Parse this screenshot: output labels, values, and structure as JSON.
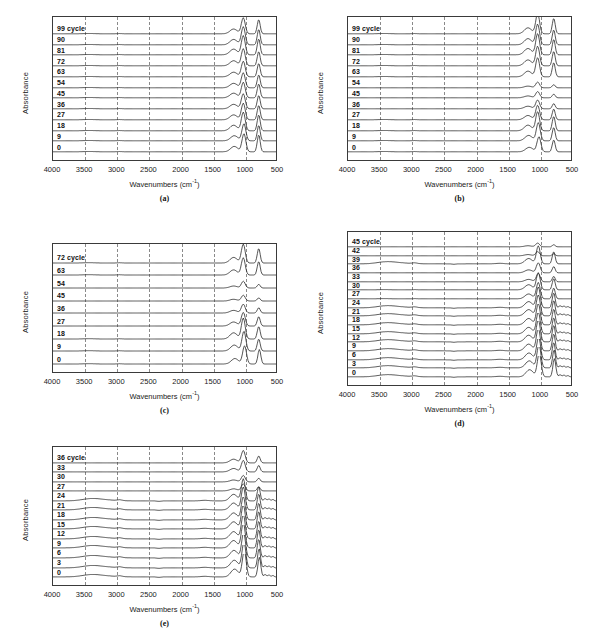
{
  "figure": {
    "background": "#ffffff",
    "line_color": "#2b2b2b",
    "grid_color": "#8a8a8a",
    "frame_color": "#3a3a3a"
  },
  "axes_common": {
    "xlabel": "Wavenumbers (cm",
    "xlabel_sup": "-1",
    "xlabel_close": ")",
    "ylabel": "Absorbance",
    "xticks": [
      "4000",
      "3500",
      "3000",
      "2500",
      "2000",
      "1500",
      "1000",
      "500"
    ],
    "xlim": [
      4000,
      500
    ],
    "grid": "vertical-dashed",
    "legend": "none"
  },
  "chart_data": [
    {
      "id": "a",
      "type": "line",
      "caption": "(a)",
      "title": "",
      "xlabel": "Wavenumbers (cm-1)",
      "ylabel": "Absorbance",
      "xlim": [
        4000,
        500
      ],
      "grid": true,
      "legend": "inline-left-labels",
      "series": [
        {
          "name": "99 cycle",
          "label": "99 cycle",
          "peaks": [
            {
              "x": 1040,
              "h": 0.62
            },
            {
              "x": 800,
              "h": 0.55
            }
          ]
        },
        {
          "name": "90",
          "label": "90",
          "peaks": [
            {
              "x": 1040,
              "h": 0.7
            },
            {
              "x": 800,
              "h": 0.6
            }
          ]
        },
        {
          "name": "81",
          "label": "81",
          "peaks": [
            {
              "x": 1040,
              "h": 0.74
            },
            {
              "x": 800,
              "h": 0.62
            }
          ]
        },
        {
          "name": "72",
          "label": "72",
          "peaks": [
            {
              "x": 1040,
              "h": 0.66
            },
            {
              "x": 800,
              "h": 0.55
            }
          ]
        },
        {
          "name": "63",
          "label": "63",
          "peaks": [
            {
              "x": 1040,
              "h": 0.6
            },
            {
              "x": 800,
              "h": 0.52
            }
          ]
        },
        {
          "name": "54",
          "label": "54",
          "peaks": [
            {
              "x": 1040,
              "h": 0.58
            },
            {
              "x": 800,
              "h": 0.5
            }
          ]
        },
        {
          "name": "45",
          "label": "45",
          "peaks": [
            {
              "x": 1040,
              "h": 0.6
            },
            {
              "x": 800,
              "h": 0.54
            }
          ]
        },
        {
          "name": "36",
          "label": "36",
          "peaks": [
            {
              "x": 1040,
              "h": 0.58
            },
            {
              "x": 800,
              "h": 0.52
            }
          ]
        },
        {
          "name": "27",
          "label": "27",
          "peaks": [
            {
              "x": 1040,
              "h": 0.64
            },
            {
              "x": 800,
              "h": 0.56
            }
          ]
        },
        {
          "name": "18",
          "label": "18",
          "peaks": [
            {
              "x": 1040,
              "h": 0.72
            },
            {
              "x": 800,
              "h": 0.62
            }
          ]
        },
        {
          "name": "9",
          "label": "9",
          "peaks": [
            {
              "x": 1030,
              "h": 0.66
            },
            {
              "x": 800,
              "h": 0.6
            }
          ]
        },
        {
          "name": "0",
          "label": "0",
          "peaks": [
            {
              "x": 1030,
              "h": 0.7
            },
            {
              "x": 800,
              "h": 0.66
            }
          ]
        }
      ]
    },
    {
      "id": "b",
      "type": "line",
      "caption": "(b)",
      "title": "",
      "xlabel": "Wavenumbers (cm-1)",
      "ylabel": "Absorbance",
      "xlim": [
        4000,
        500
      ],
      "grid": true,
      "legend": "inline-left-labels",
      "series": [
        {
          "name": "99 cycle",
          "label": "99 cycle",
          "peaks": [
            {
              "x": 1050,
              "h": 0.78
            },
            {
              "x": 800,
              "h": 0.6
            }
          ]
        },
        {
          "name": "90",
          "label": "90",
          "peaks": [
            {
              "x": 1050,
              "h": 0.8
            },
            {
              "x": 800,
              "h": 0.58
            }
          ]
        },
        {
          "name": "81",
          "label": "81",
          "peaks": [
            {
              "x": 1050,
              "h": 0.82
            },
            {
              "x": 800,
              "h": 0.6
            }
          ]
        },
        {
          "name": "72",
          "label": "72",
          "peaks": [
            {
              "x": 1050,
              "h": 0.76
            },
            {
              "x": 800,
              "h": 0.56
            }
          ]
        },
        {
          "name": "63",
          "label": "63",
          "peaks": [
            {
              "x": 1050,
              "h": 0.74
            },
            {
              "x": 800,
              "h": 0.55
            }
          ]
        },
        {
          "name": "54",
          "label": "54",
          "peaks": [
            {
              "x": 1050,
              "h": 0.22
            },
            {
              "x": 800,
              "h": 0.12
            }
          ]
        },
        {
          "name": "45",
          "label": "45",
          "peaks": [
            {
              "x": 1050,
              "h": 0.24
            },
            {
              "x": 800,
              "h": 0.14
            }
          ]
        },
        {
          "name": "36",
          "label": "36",
          "peaks": [
            {
              "x": 1050,
              "h": 0.34
            },
            {
              "x": 800,
              "h": 0.2
            }
          ]
        },
        {
          "name": "27",
          "label": "27",
          "peaks": [
            {
              "x": 1050,
              "h": 0.56
            },
            {
              "x": 800,
              "h": 0.42
            }
          ]
        },
        {
          "name": "18",
          "label": "18",
          "peaks": [
            {
              "x": 1050,
              "h": 0.74
            },
            {
              "x": 800,
              "h": 0.56
            }
          ]
        },
        {
          "name": "9",
          "label": "9",
          "peaks": [
            {
              "x": 1040,
              "h": 0.7
            },
            {
              "x": 800,
              "h": 0.52
            }
          ]
        },
        {
          "name": "0",
          "label": "0",
          "peaks": [
            {
              "x": 1030,
              "h": 0.58
            },
            {
              "x": 800,
              "h": 0.46
            }
          ]
        }
      ]
    },
    {
      "id": "c",
      "type": "line",
      "caption": "(c)",
      "title": "",
      "xlabel": "Wavenumbers (cm-1)",
      "ylabel": "Absorbance",
      "xlim": [
        4000,
        500
      ],
      "grid": true,
      "legend": "inline-left-labels",
      "series": [
        {
          "name": "72 cycle",
          "label": "72 cycle",
          "peaks": [
            {
              "x": 1040,
              "h": 0.72
            },
            {
              "x": 800,
              "h": 0.56
            }
          ]
        },
        {
          "name": "63",
          "label": "63",
          "peaks": [
            {
              "x": 1040,
              "h": 0.66
            },
            {
              "x": 800,
              "h": 0.52
            }
          ]
        },
        {
          "name": "54",
          "label": "54",
          "peaks": [
            {
              "x": 1040,
              "h": 0.26
            },
            {
              "x": 800,
              "h": 0.14
            }
          ]
        },
        {
          "name": "45",
          "label": "45",
          "peaks": [
            {
              "x": 1040,
              "h": 0.22
            },
            {
              "x": 800,
              "h": 0.12
            }
          ]
        },
        {
          "name": "36",
          "label": "36",
          "peaks": [
            {
              "x": 1040,
              "h": 0.34
            },
            {
              "x": 800,
              "h": 0.2
            }
          ]
        },
        {
          "name": "27",
          "label": "27",
          "peaks": [
            {
              "x": 1040,
              "h": 0.52
            },
            {
              "x": 800,
              "h": 0.36
            }
          ]
        },
        {
          "name": "18",
          "label": "18",
          "peaks": [
            {
              "x": 1040,
              "h": 0.8
            },
            {
              "x": 800,
              "h": 0.48
            }
          ]
        },
        {
          "name": "9",
          "label": "9",
          "peaks": [
            {
              "x": 1030,
              "h": 0.76
            },
            {
              "x": 800,
              "h": 0.46
            }
          ]
        },
        {
          "name": "0",
          "label": "0",
          "peaks": [
            {
              "x": 1020,
              "h": 0.7
            },
            {
              "x": 790,
              "h": 0.56
            }
          ]
        }
      ]
    },
    {
      "id": "d",
      "type": "line",
      "caption": "(d)",
      "title": "",
      "xlabel": "Wavenumbers (cm-1)",
      "ylabel": "Absorbance",
      "xlim": [
        4000,
        500
      ],
      "grid": true,
      "legend": "inline-left-labels",
      "series": [
        {
          "name": "45 cycle",
          "label": "45 cycle",
          "peaks": [
            {
              "x": 1050,
              "h": 0.18
            },
            {
              "x": 800,
              "h": 0.1
            }
          ]
        },
        {
          "name": "42",
          "label": "42",
          "peaks": [
            {
              "x": 1050,
              "h": 0.2
            },
            {
              "x": 800,
              "h": 0.1
            }
          ]
        },
        {
          "name": "39",
          "label": "39",
          "peaks": [
            {
              "x": 1040,
              "h": 0.86
            },
            {
              "x": 800,
              "h": 0.58
            }
          ]
        },
        {
          "name": "36",
          "label": "36",
          "peaks": [
            {
              "x": 1040,
              "h": 0.48
            },
            {
              "x": 800,
              "h": 0.3
            }
          ]
        },
        {
          "name": "33",
          "label": "33",
          "peaks": [
            {
              "x": 1040,
              "h": 0.4
            },
            {
              "x": 800,
              "h": 0.26
            }
          ]
        },
        {
          "name": "30",
          "label": "30",
          "peaks": [
            {
              "x": 1040,
              "h": 0.82
            },
            {
              "x": 800,
              "h": 0.54
            }
          ]
        },
        {
          "name": "27",
          "label": "27",
          "peaks": [
            {
              "x": 1040,
              "h": 0.78
            },
            {
              "x": 800,
              "h": 0.52
            }
          ]
        },
        {
          "name": "24",
          "label": "24",
          "peaks": [
            {
              "x": 1040,
              "h": 1.0
            },
            {
              "x": 800,
              "h": 0.72
            }
          ]
        },
        {
          "name": "21",
          "label": "21",
          "peaks": [
            {
              "x": 1040,
              "h": 1.0
            },
            {
              "x": 800,
              "h": 0.74
            }
          ]
        },
        {
          "name": "18",
          "label": "18",
          "peaks": [
            {
              "x": 1040,
              "h": 1.02
            },
            {
              "x": 800,
              "h": 0.76
            }
          ]
        },
        {
          "name": "15",
          "label": "15",
          "peaks": [
            {
              "x": 1040,
              "h": 1.04
            },
            {
              "x": 800,
              "h": 0.78
            }
          ]
        },
        {
          "name": "12",
          "label": "12",
          "peaks": [
            {
              "x": 1040,
              "h": 1.06
            },
            {
              "x": 800,
              "h": 0.8
            }
          ]
        },
        {
          "name": "9",
          "label": "9",
          "peaks": [
            {
              "x": 1040,
              "h": 1.08
            },
            {
              "x": 800,
              "h": 0.82
            }
          ]
        },
        {
          "name": "6",
          "label": "6",
          "peaks": [
            {
              "x": 1035,
              "h": 1.1
            },
            {
              "x": 800,
              "h": 0.84
            }
          ]
        },
        {
          "name": "3",
          "label": "3",
          "peaks": [
            {
              "x": 1030,
              "h": 1.12
            },
            {
              "x": 795,
              "h": 0.86
            }
          ]
        },
        {
          "name": "0",
          "label": "0",
          "peaks": [
            {
              "x": 1025,
              "h": 1.14
            },
            {
              "x": 790,
              "h": 0.88
            }
          ]
        }
      ]
    },
    {
      "id": "e",
      "type": "line",
      "caption": "(e)",
      "title": "",
      "xlabel": "Wavenumbers (cm-1)",
      "ylabel": "Absorbance",
      "xlim": [
        4000,
        500
      ],
      "grid": true,
      "legend": "inline-left-labels",
      "series": [
        {
          "name": "36 cycle",
          "label": "36 cycle",
          "peaks": [
            {
              "x": 1040,
              "h": 0.54
            },
            {
              "x": 800,
              "h": 0.3
            }
          ]
        },
        {
          "name": "33",
          "label": "33",
          "peaks": [
            {
              "x": 1040,
              "h": 0.5
            },
            {
              "x": 800,
              "h": 0.28
            }
          ]
        },
        {
          "name": "30",
          "label": "30",
          "peaks": [
            {
              "x": 1040,
              "h": 0.28
            },
            {
              "x": 800,
              "h": 0.16
            }
          ]
        },
        {
          "name": "27",
          "label": "27",
          "peaks": [
            {
              "x": 1040,
              "h": 0.3
            },
            {
              "x": 800,
              "h": 0.18
            }
          ]
        },
        {
          "name": "24",
          "label": "24",
          "peaks": [
            {
              "x": 1040,
              "h": 0.96
            },
            {
              "x": 800,
              "h": 0.62
            }
          ]
        },
        {
          "name": "21",
          "label": "21",
          "peaks": [
            {
              "x": 1040,
              "h": 1.0
            },
            {
              "x": 800,
              "h": 0.7
            }
          ]
        },
        {
          "name": "18",
          "label": "18",
          "peaks": [
            {
              "x": 1040,
              "h": 1.02
            },
            {
              "x": 800,
              "h": 0.74
            }
          ]
        },
        {
          "name": "15",
          "label": "15",
          "peaks": [
            {
              "x": 1040,
              "h": 1.04
            },
            {
              "x": 800,
              "h": 0.76
            }
          ]
        },
        {
          "name": "12",
          "label": "12",
          "peaks": [
            {
              "x": 1040,
              "h": 1.06
            },
            {
              "x": 800,
              "h": 0.78
            }
          ]
        },
        {
          "name": "9",
          "label": "9",
          "peaks": [
            {
              "x": 1040,
              "h": 1.08
            },
            {
              "x": 800,
              "h": 0.8
            }
          ]
        },
        {
          "name": "6",
          "label": "6",
          "peaks": [
            {
              "x": 1035,
              "h": 1.1
            },
            {
              "x": 800,
              "h": 0.82
            }
          ]
        },
        {
          "name": "3",
          "label": "3",
          "peaks": [
            {
              "x": 1030,
              "h": 1.12
            },
            {
              "x": 795,
              "h": 0.84
            }
          ]
        },
        {
          "name": "0",
          "label": "0",
          "peaks": [
            {
              "x": 1025,
              "h": 1.14
            },
            {
              "x": 790,
              "h": 0.86
            }
          ]
        }
      ]
    }
  ]
}
